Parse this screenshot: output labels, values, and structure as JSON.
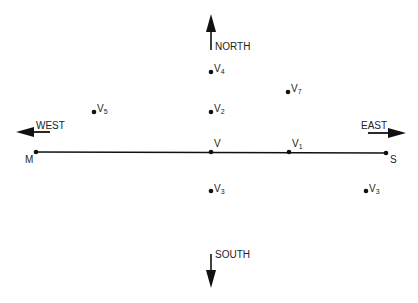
{
  "directions": {
    "north": "NORTH",
    "south": "SOUTH",
    "east": "EAST",
    "west": "WEST"
  },
  "endpoints": {
    "left": "M",
    "right": "S"
  },
  "points": [
    {
      "id": "V",
      "base": "V",
      "sub": "",
      "x": 211,
      "y": 152
    },
    {
      "id": "V1",
      "base": "V",
      "sub": "1",
      "x": 289,
      "y": 152
    },
    {
      "id": "V2",
      "base": "V",
      "sub": "2",
      "x": 211,
      "y": 112
    },
    {
      "id": "V3a",
      "base": "V",
      "sub": "3",
      "x": 211,
      "y": 191
    },
    {
      "id": "V3b",
      "base": "V",
      "sub": "3",
      "x": 366,
      "y": 191
    },
    {
      "id": "V4",
      "base": "V",
      "sub": "4",
      "x": 211,
      "y": 72
    },
    {
      "id": "V5",
      "base": "V",
      "sub": "5",
      "x": 94,
      "y": 112
    },
    {
      "id": "V7",
      "base": "V",
      "sub": "7",
      "x": 288,
      "y": 92
    }
  ],
  "labels": {
    "V": {
      "base": "V",
      "sub": ""
    },
    "V1": {
      "base": "V",
      "sub": "1"
    },
    "V2": {
      "base": "V",
      "sub": "2"
    },
    "V3a": {
      "base": "V",
      "sub": "3"
    },
    "V3b": {
      "base": "V",
      "sub": "3"
    },
    "V4": {
      "base": "V",
      "sub": "4"
    },
    "V5": {
      "base": "V",
      "sub": "5"
    },
    "V7": {
      "base": "V",
      "sub": "7"
    }
  }
}
